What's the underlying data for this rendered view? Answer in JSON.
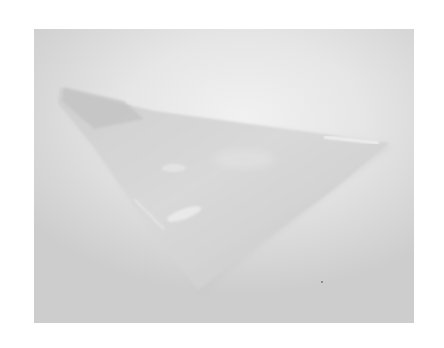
{
  "image": {
    "subject": "translucent triangular object",
    "background_color": "#e2e2e2",
    "object_color": "#d0d0d0",
    "highlight_color": "#f2f2f2",
    "photo_bounds": {
      "x": 34,
      "y": 29,
      "width": 380,
      "height": 294
    },
    "object_vertices": {
      "left_tip": [
        64,
        88
      ],
      "right_tip": [
        391,
        143
      ],
      "bottom_tip": [
        198,
        290
      ]
    }
  },
  "caption": {
    "text": ""
  }
}
